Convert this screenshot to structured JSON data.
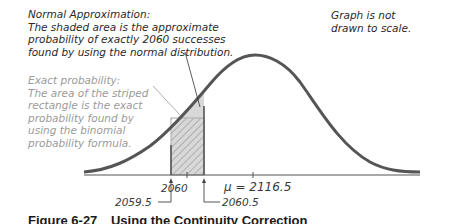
{
  "figure": {
    "caption_number": "Figure 6-27",
    "caption_title": "Using the Continuity Correction"
  },
  "annotations": {
    "normal_approximation": {
      "lines": [
        "Normal Approximation:",
        "The shaded area is the approximate",
        "probability of exactly 2060 successes",
        "found by using the normal distribution."
      ]
    },
    "exact_probability": {
      "lines": [
        "Exact probability:",
        "The area of the striped",
        "rectangle is the exact",
        "probability found by",
        "using the binomial",
        "probability formula."
      ]
    },
    "scale_note": {
      "lines": [
        "Graph is not",
        "drawn to scale."
      ]
    }
  },
  "axis": {
    "tick_x": "2060",
    "mean_label": "μ = 2116.5",
    "lower_boundary": "2059.5",
    "upper_boundary": "2060.5"
  },
  "colors": {
    "curve": "#555555",
    "axis": "#555555",
    "shaded_fill": "#d8d8d8",
    "rect_outline": "#aaaaaa",
    "hatch": "#8a8a8a",
    "dark_text": "#2a2a2a",
    "light_text": "#9a9a9a"
  }
}
